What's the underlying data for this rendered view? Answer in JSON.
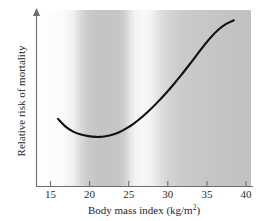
{
  "chart_data": {
    "type": "line",
    "title": "",
    "xlabel": "Body mass index (kg/m²)",
    "xlabel_main": "Body mass index (kg/m",
    "xlabel_sup": "2",
    "xlabel_tail": ")",
    "ylabel": "Relative risk of mortality",
    "xlim": [
      13.2,
      41.5
    ],
    "ylim": [
      0,
      1
    ],
    "xticks": [
      15,
      20,
      25,
      30,
      35,
      40
    ],
    "xticklabels": [
      "15",
      "20",
      "25",
      "30",
      "35",
      "40"
    ],
    "yticks": [],
    "yticklabels": [],
    "grid": false,
    "legend": null,
    "y_axis_arrow": true,
    "y_axis_units": "unlabeled relative scale",
    "series": [
      {
        "name": "Relative risk of mortality",
        "color": "#111111",
        "x": [
          16.0,
          17.0,
          18.0,
          19.0,
          20.0,
          21.0,
          21.5,
          22.0,
          23.0,
          24.0,
          25.0,
          26.0,
          27.0,
          28.0,
          29.0,
          30.0,
          31.0,
          32.0,
          33.0,
          34.0,
          35.0,
          36.0,
          37.0,
          38.0,
          39.0
        ],
        "y": [
          0.345,
          0.295,
          0.262,
          0.243,
          0.233,
          0.228,
          0.228,
          0.23,
          0.24,
          0.258,
          0.285,
          0.318,
          0.357,
          0.402,
          0.452,
          0.505,
          0.562,
          0.622,
          0.685,
          0.75,
          0.815,
          0.875,
          0.925,
          0.962,
          0.985
        ],
        "minimum_x": 21.5,
        "shape": "U-shaped (J-curve)"
      }
    ],
    "background_bands": {
      "description": "vertical grayscale gradient shading behind plot area",
      "stops": [
        {
          "bmi": 13.2,
          "shade": "#ffffff"
        },
        {
          "bmi": 16.5,
          "shade": "#fbfbfb"
        },
        {
          "bmi": 18.5,
          "shade": "#d2d2d2"
        },
        {
          "bmi": 20.5,
          "shade": "#c4c4c4"
        },
        {
          "bmi": 23.5,
          "shade": "#c8c8c8"
        },
        {
          "bmi": 25.0,
          "shade": "#efefef"
        },
        {
          "bmi": 26.5,
          "shade": "#f7f7f7"
        },
        {
          "bmi": 28.5,
          "shade": "#e0e0e0"
        },
        {
          "bmi": 31.0,
          "shade": "#cdcdcd"
        },
        {
          "bmi": 35.0,
          "shade": "#c6c6c6"
        },
        {
          "bmi": 40.3,
          "shade": "#c2c2c2"
        }
      ]
    }
  },
  "figure": {
    "background_color": "#ffffff",
    "curve_color": "#111111",
    "axis_color": "#6d6d6d",
    "text_color": "#1f1f1f"
  }
}
